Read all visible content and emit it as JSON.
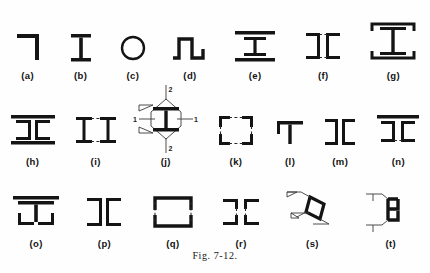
{
  "figure": {
    "caption": "Fig. 7-12.",
    "rows": [
      {
        "items": [
          {
            "key": "a",
            "label": "(a)",
            "shape": "angle-section"
          },
          {
            "key": "b",
            "label": "(b)",
            "shape": "i-beam"
          },
          {
            "key": "c",
            "label": "(c)",
            "shape": "circular-tube"
          },
          {
            "key": "d",
            "label": "(d)",
            "shape": "hat-section"
          },
          {
            "key": "e",
            "label": "(e)",
            "shape": "i-beam-with-cover-plates"
          },
          {
            "key": "f",
            "label": "(f)",
            "shape": "two-channels-back-to-back-laced"
          },
          {
            "key": "g",
            "label": "(g)",
            "shape": "i-beam-with-channel-caps"
          }
        ]
      },
      {
        "items": [
          {
            "key": "h",
            "label": "(h)",
            "shape": "two-channels-with-cover-plates"
          },
          {
            "key": "i",
            "label": "(i)",
            "shape": "two-i-beams-laced"
          },
          {
            "key": "j",
            "label": "(j)",
            "shape": "i-beam-with-section-marks",
            "marks": {
              "axis_1": "1",
              "axis_2": "2"
            }
          },
          {
            "key": "k",
            "label": "(k)",
            "shape": "four-angles-box-laced"
          },
          {
            "key": "l",
            "label": "(l)",
            "shape": "tee-section"
          },
          {
            "key": "m",
            "label": "(m)",
            "shape": "two-channels-toe-to-toe"
          },
          {
            "key": "n",
            "label": "(n)",
            "shape": "two-channels-with-top-plate-laced"
          }
        ]
      },
      {
        "items": [
          {
            "key": "o",
            "label": "(o)",
            "shape": "i-beam-cover-plate-and-angles"
          },
          {
            "key": "p",
            "label": "(p)",
            "shape": "four-angles-i-section"
          },
          {
            "key": "q",
            "label": "(q)",
            "shape": "two-channels-box-laced"
          },
          {
            "key": "r",
            "label": "(r)",
            "shape": "four-angles-laced-i-section"
          },
          {
            "key": "s",
            "label": "(s)",
            "shape": "box-section-diagonal-with-weld-symbols"
          },
          {
            "key": "t",
            "label": "(t)",
            "shape": "box-section-with-weld-symbols"
          }
        ]
      }
    ]
  }
}
